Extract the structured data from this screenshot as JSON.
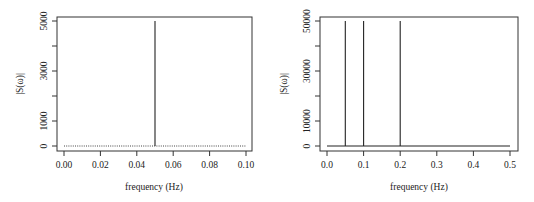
{
  "chart_data": [
    {
      "type": "line",
      "subtype": "spectrum",
      "title": "",
      "xlabel": "frequency (Hz)",
      "ylabel": "|S(ω)|",
      "xlim": [
        0.0,
        0.1
      ],
      "ylim": [
        0,
        5000
      ],
      "grid": false,
      "x_ticks": [
        "0.00",
        "0.02",
        "0.04",
        "0.06",
        "0.08",
        "0.10"
      ],
      "y_ticks": [
        "0",
        "1000",
        "3000",
        "5000"
      ],
      "y_minor_ticks": [
        0,
        1000,
        2000,
        3000,
        4000,
        5000
      ],
      "baseline": {
        "style": "dotted",
        "x_from": 0.0,
        "x_to": 0.1,
        "y": 0
      },
      "spikes": [
        {
          "x": 0.05,
          "y": 5000
        }
      ]
    },
    {
      "type": "line",
      "subtype": "spectrum",
      "title": "",
      "xlabel": "frequency (Hz)",
      "ylabel": "|S(ω)|",
      "xlim": [
        0.0,
        0.5
      ],
      "ylim": [
        0,
        50000
      ],
      "grid": false,
      "x_ticks": [
        "0.0",
        "0.1",
        "0.2",
        "0.3",
        "0.4",
        "0.5"
      ],
      "y_ticks": [
        "0",
        "10000",
        "30000",
        "50000"
      ],
      "y_minor_ticks": [
        0,
        10000,
        20000,
        30000,
        40000,
        50000
      ],
      "baseline": {
        "style": "solid",
        "x_from": 0.0,
        "x_to": 0.5,
        "y": 0
      },
      "spikes": [
        {
          "x": 0.05,
          "y": 50000
        },
        {
          "x": 0.1,
          "y": 50000
        },
        {
          "x": 0.2,
          "y": 50000
        }
      ]
    }
  ],
  "colors": {
    "line": "#222222",
    "frame": "#333333",
    "background": "#ffffff"
  }
}
